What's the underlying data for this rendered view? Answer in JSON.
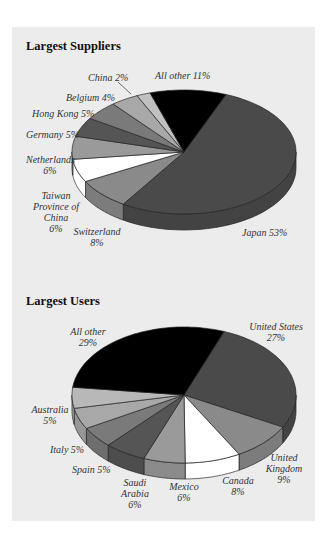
{
  "chart_data": [
    {
      "type": "pie",
      "title": "Largest Suppliers",
      "categories": [
        "Japan",
        "Switzerland",
        "Taiwan Province of China",
        "Netherlands",
        "Germany",
        "Hong Kong",
        "Belgium",
        "China",
        "All other"
      ],
      "values": [
        53,
        8,
        6,
        6,
        5,
        5,
        4,
        2,
        11
      ],
      "unit": "%",
      "colors": [
        "#4a4a4a",
        "#8a8a8a",
        "#ffffff",
        "#9a9a9a",
        "#555555",
        "#7a7a7a",
        "#a8a8a8",
        "#c0c0c0",
        "#000000"
      ],
      "style": "3d-tilted",
      "legend": "none (direct labels)"
    },
    {
      "type": "pie",
      "title": "Largest Users",
      "categories": [
        "United States",
        "United Kingdom",
        "Canada",
        "Mexico",
        "Saudi Arabia",
        "Spain",
        "Italy",
        "Australia",
        "All other"
      ],
      "values": [
        27,
        9,
        8,
        6,
        6,
        5,
        5,
        5,
        29
      ],
      "unit": "%",
      "colors": [
        "#4a4a4a",
        "#8a8a8a",
        "#ffffff",
        "#9a9a9a",
        "#555555",
        "#7a7a7a",
        "#a8a8a8",
        "#b8b8b8",
        "#000000"
      ],
      "style": "3d-tilted",
      "legend": "none (direct labels)"
    }
  ],
  "suppliers": {
    "title": "Largest Suppliers",
    "labels": {
      "china": "China 2%",
      "all_other": "All other 11%",
      "belgium": "Belgium 4%",
      "hong_kong": "Hong Kong 5%",
      "germany": "Germany 5%",
      "netherlands_1": "Netherlands",
      "netherlands_2": "6%",
      "taiwan_1": "Taiwan",
      "taiwan_2": "Province of",
      "taiwan_3": "China",
      "taiwan_4": "6%",
      "switzerland_1": "Switzerland",
      "switzerland_2": "8%",
      "japan": "Japan 53%"
    }
  },
  "users": {
    "title": "Largest Users",
    "labels": {
      "all_other_1": "All other",
      "all_other_2": "29%",
      "us_1": "United States",
      "us_2": "27%",
      "australia_1": "Australia",
      "australia_2": "5%",
      "italy": "Italy 5%",
      "spain": "Spain 5%",
      "saudi_1": "Saudi",
      "saudi_2": "Arabia",
      "saudi_3": "6%",
      "mexico_1": "Mexico",
      "mexico_2": "6%",
      "canada_1": "Canada",
      "canada_2": "8%",
      "uk_1": "United",
      "uk_2": "Kingdom",
      "uk_3": "9%"
    }
  }
}
